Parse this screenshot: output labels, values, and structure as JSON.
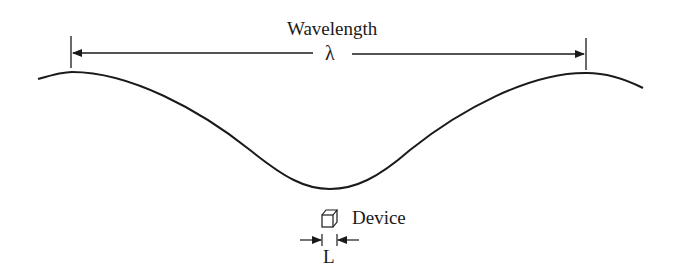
{
  "diagram": {
    "title_label": "Wavelength",
    "symbol": "λ",
    "device_label": "Device",
    "length_label": "L",
    "colors": {
      "line": "#1a1a1a",
      "background": "#ffffff"
    }
  }
}
